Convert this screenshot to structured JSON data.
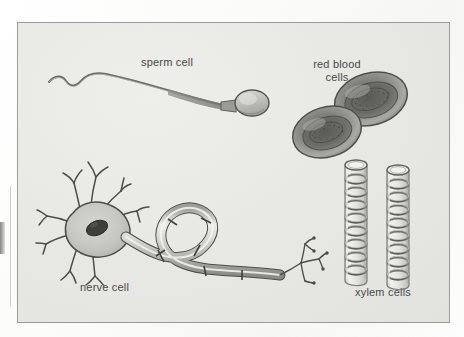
{
  "page": {
    "type": "biology-diagram",
    "background_color": "#fdfdfc",
    "frame_background_color": "#e9e9e6",
    "frame_border_color": "#9a9a97"
  },
  "labels": {
    "sperm": "sperm cell",
    "red_blood_line1": "red blood",
    "red_blood_line2": "cells",
    "nerve": "nerve cell",
    "xylem": "xylem cells",
    "text_color": "#4a4a4a"
  },
  "illustrations": {
    "sperm_cell": {
      "name": "sperm-cell-drawing",
      "parts": [
        "wavy flagellum tail",
        "midpiece",
        "oval head"
      ],
      "orientation": "head at right, tail trailing to the left"
    },
    "red_blood_cells": {
      "name": "red-blood-cells-drawing",
      "count": 2,
      "parts": [
        "biconcave disc rim",
        "dark concave centre",
        "stippled shading"
      ],
      "arrangement": "two overlapping tilted discs"
    },
    "nerve_cell": {
      "name": "nerve-cell-drawing",
      "parts": [
        "cell body",
        "nucleus",
        "dendrites",
        "myelinated axon",
        "nodes of Ranvier",
        "axon terminals"
      ],
      "arrangement": "star-shaped soma at left, long S-curved axon to the right ending in branched terminals"
    },
    "xylem_cells": {
      "name": "xylem-cells-drawing",
      "count": 2,
      "parts": [
        "hollow tube",
        "spiral lignin thickening rings",
        "open top"
      ],
      "arrangement": "two vertical tubes side by side"
    }
  }
}
